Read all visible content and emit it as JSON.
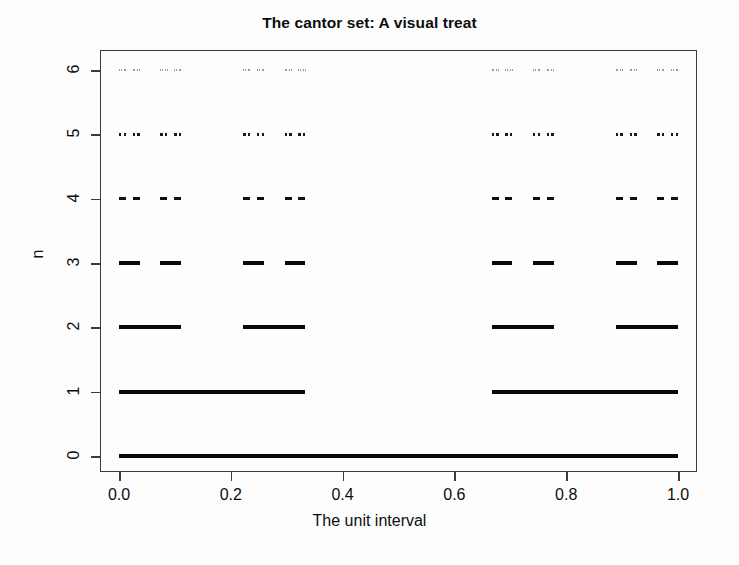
{
  "chart_data": {
    "type": "line",
    "title": "The cantor set: A visual treat",
    "xlabel": "The unit interval",
    "ylabel": "n",
    "xlim": [
      0.0,
      1.0
    ],
    "ylim": [
      0,
      6
    ],
    "grid": false,
    "legend": null,
    "xticks": [
      0.0,
      0.2,
      0.4,
      0.6,
      0.8,
      1.0
    ],
    "xticklabels": [
      "0.0",
      "0.2",
      "0.4",
      "0.6",
      "0.8",
      "1.0"
    ],
    "yticks": [
      0,
      1,
      2,
      3,
      4,
      5,
      6
    ],
    "yticklabels": [
      "0",
      "1",
      "2",
      "3",
      "4",
      "5",
      "6"
    ],
    "series": [
      {
        "name": "n = 0",
        "n": 0,
        "segment_count": 1,
        "segment_length": 1,
        "line_width": 4.2,
        "color": "#0a0a0a",
        "segments": [
          [
            0,
            1
          ]
        ]
      },
      {
        "name": "n = 1",
        "n": 1,
        "segment_count": 2,
        "segment_length": 0.333333,
        "line_width": 4.0,
        "color": "#0a0a0a",
        "segments": [
          [
            0,
            0.333333
          ],
          [
            0.666667,
            1
          ]
        ]
      },
      {
        "name": "n = 2",
        "n": 2,
        "segment_count": 4,
        "segment_length": 0.111111,
        "line_width": 3.8,
        "color": "#0a0a0a",
        "segments": [
          [
            0,
            0.111111
          ],
          [
            0.222222,
            0.333333
          ],
          [
            0.666667,
            0.777778
          ],
          [
            0.888889,
            1
          ]
        ]
      },
      {
        "name": "n = 3",
        "n": 3,
        "segment_count": 8,
        "segment_length": 0.037037,
        "line_width": 3.6,
        "color": "#0a0a0a",
        "segments": [
          [
            0,
            0.037037
          ],
          [
            0.074074,
            0.111111
          ],
          [
            0.222222,
            0.259259
          ],
          [
            0.296296,
            0.333333
          ],
          [
            0.666667,
            0.703704
          ],
          [
            0.740741,
            0.777778
          ],
          [
            0.888889,
            0.925926
          ],
          [
            0.962963,
            1
          ]
        ]
      },
      {
        "name": "n = 4",
        "n": 4,
        "segment_count": 16,
        "segment_length": 0.012346,
        "line_width": 3.2,
        "color": "#111111",
        "segments": [
          [
            0,
            0.012346
          ],
          [
            0.024691,
            0.037037
          ],
          [
            0.074074,
            0.08642
          ],
          [
            0.098765,
            0.111111
          ],
          [
            0.222222,
            0.234568
          ],
          [
            0.246914,
            0.259259
          ],
          [
            0.296296,
            0.308642
          ],
          [
            0.320988,
            0.333333
          ],
          [
            0.666667,
            0.679012
          ],
          [
            0.691358,
            0.703704
          ],
          [
            0.740741,
            0.753086
          ],
          [
            0.765432,
            0.777778
          ],
          [
            0.888889,
            0.901235
          ],
          [
            0.91358,
            0.925926
          ],
          [
            0.962963,
            0.975309
          ],
          [
            0.987654,
            1
          ]
        ]
      },
      {
        "name": "n = 5",
        "n": 5,
        "segment_count": 32,
        "segment_length": 0.004115,
        "line_width": 2.6,
        "color": "#1a1a1a",
        "segments": [
          [
            0,
            0.004115
          ],
          [
            0.00823,
            0.012346
          ],
          [
            0.024691,
            0.028807
          ],
          [
            0.032922,
            0.037037
          ],
          [
            0.074074,
            0.078189
          ],
          [
            0.082305,
            0.08642
          ],
          [
            0.098765,
            0.102881
          ],
          [
            0.106996,
            0.111111
          ],
          [
            0.222222,
            0.226337
          ],
          [
            0.230453,
            0.234568
          ],
          [
            0.246914,
            0.251029
          ],
          [
            0.255144,
            0.259259
          ],
          [
            0.296296,
            0.300412
          ],
          [
            0.304527,
            0.308642
          ],
          [
            0.320988,
            0.325103
          ],
          [
            0.329218,
            0.333333
          ],
          [
            0.666667,
            0.670782
          ],
          [
            0.674897,
            0.679012
          ],
          [
            0.691358,
            0.695473
          ],
          [
            0.699588,
            0.703704
          ],
          [
            0.740741,
            0.744856
          ],
          [
            0.748971,
            0.753086
          ],
          [
            0.765432,
            0.769547
          ],
          [
            0.773663,
            0.777778
          ],
          [
            0.888889,
            0.893004
          ],
          [
            0.897119,
            0.901235
          ],
          [
            0.91358,
            0.917695
          ],
          [
            0.921811,
            0.925926
          ],
          [
            0.962963,
            0.967078
          ],
          [
            0.971193,
            0.975309
          ],
          [
            0.987654,
            0.99177
          ],
          [
            0.995885,
            1
          ]
        ]
      },
      {
        "name": "n = 6",
        "n": 6,
        "segment_count": 64,
        "segment_length": 0.001372,
        "line_width": 1.3,
        "color": "#9a9a9a",
        "segments": [
          [
            0,
            0.001372
          ],
          [
            0.002743,
            0.004115
          ],
          [
            0.00823,
            0.009602
          ],
          [
            0.010974,
            0.012346
          ],
          [
            0.024691,
            0.026063
          ],
          [
            0.027435,
            0.028807
          ],
          [
            0.032922,
            0.034294
          ],
          [
            0.035665,
            0.037037
          ],
          [
            0.074074,
            0.075446
          ],
          [
            0.076817,
            0.078189
          ],
          [
            0.082305,
            0.083676
          ],
          [
            0.085048,
            0.08642
          ],
          [
            0.098765,
            0.100137
          ],
          [
            0.101509,
            0.102881
          ],
          [
            0.106996,
            0.108368
          ],
          [
            0.109739,
            0.111111
          ],
          [
            0.222222,
            0.223594
          ],
          [
            0.224966,
            0.226337
          ],
          [
            0.230453,
            0.231825
          ],
          [
            0.233196,
            0.234568
          ],
          [
            0.246914,
            0.248285
          ],
          [
            0.249657,
            0.251029
          ],
          [
            0.255144,
            0.256516
          ],
          [
            0.257888,
            0.259259
          ],
          [
            0.296296,
            0.297668
          ],
          [
            0.29904,
            0.300412
          ],
          [
            0.304527,
            0.305899
          ],
          [
            0.30727,
            0.308642
          ],
          [
            0.320988,
            0.322359
          ],
          [
            0.323731,
            0.325103
          ],
          [
            0.329218,
            0.33059
          ],
          [
            0.331962,
            0.333333
          ],
          [
            0.666667,
            0.668038
          ],
          [
            0.66941,
            0.670782
          ],
          [
            0.674897,
            0.676269
          ],
          [
            0.67764,
            0.679012
          ],
          [
            0.691358,
            0.69273
          ],
          [
            0.694102,
            0.695473
          ],
          [
            0.699588,
            0.70096
          ],
          [
            0.702332,
            0.703704
          ],
          [
            0.740741,
            0.742112
          ],
          [
            0.743484,
            0.744856
          ],
          [
            0.748971,
            0.750343
          ],
          [
            0.751715,
            0.753086
          ],
          [
            0.765432,
            0.766804
          ],
          [
            0.768176,
            0.769547
          ],
          [
            0.773663,
            0.775034
          ],
          [
            0.776406,
            0.777778
          ],
          [
            0.888889,
            0.89026
          ],
          [
            0.891632,
            0.893004
          ],
          [
            0.897119,
            0.898491
          ],
          [
            0.899863,
            0.901235
          ],
          [
            0.91358,
            0.914952
          ],
          [
            0.916324,
            0.917695
          ],
          [
            0.921811,
            0.923183
          ],
          [
            0.924554,
            0.925926
          ],
          [
            0.962963,
            0.964335
          ],
          [
            0.965706,
            0.967078
          ],
          [
            0.971193,
            0.972565
          ],
          [
            0.973937,
            0.975309
          ],
          [
            0.987654,
            0.989026
          ],
          [
            0.990398,
            0.99177
          ],
          [
            0.995885,
            0.997257
          ],
          [
            0.998628,
            1
          ]
        ]
      }
    ]
  }
}
